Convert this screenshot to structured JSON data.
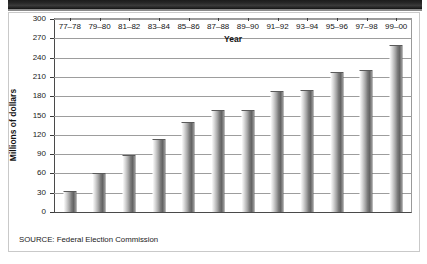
{
  "figure": {
    "title_band_label": "",
    "source_note": "SOURCE: Federal Election Commission"
  },
  "chart_data": {
    "type": "bar",
    "title": "",
    "xlabel": "Year",
    "ylabel": "Millions of dollars",
    "categories": [
      "77–78",
      "79–80",
      "81–82",
      "83–84",
      "85–86",
      "87–88",
      "89–90",
      "91–92",
      "93–94",
      "95–96",
      "97–98",
      "99–00"
    ],
    "values": [
      32,
      60,
      88,
      113,
      140,
      159,
      159,
      188,
      189,
      217,
      220,
      260
    ],
    "ylim": [
      0,
      300
    ],
    "ytick_values": [
      0,
      30,
      60,
      90,
      120,
      150,
      180,
      210,
      240,
      270,
      300
    ],
    "ytick_labels": [
      "0",
      "30",
      "60",
      "90",
      "120",
      "150",
      "180",
      "210",
      "240",
      "270",
      "300"
    ],
    "grid": true,
    "grid_axis": "y",
    "legend": false,
    "bar_color": "#7b7b7b",
    "bar_style": "gradient-cylinder"
  }
}
